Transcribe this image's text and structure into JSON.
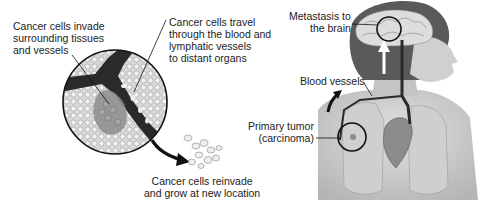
{
  "diagram": {
    "labels": {
      "invade": [
        "Cancer cells invade",
        "surrounding tissues",
        "and vessels"
      ],
      "travel": [
        "Cancer cells travel",
        "through the blood and",
        "lymphatic vessels",
        "to distant organs"
      ],
      "reinvade": [
        "Cancer cells reinvade",
        "and grow at new location"
      ],
      "metastasis": [
        "Metastasis to",
        "the brain"
      ],
      "blood_vessels": [
        "Blood vessels"
      ],
      "primary_tumor": [
        "Primary tumor",
        "(carcinoma)"
      ]
    },
    "colors": {
      "vessel": "#2a2a2a",
      "tissue": "#e6e6e6",
      "tumor": "#8c8c8c",
      "skin": "#cfcfcf",
      "hair": "#5a5a5a",
      "outline": "#111111"
    }
  }
}
